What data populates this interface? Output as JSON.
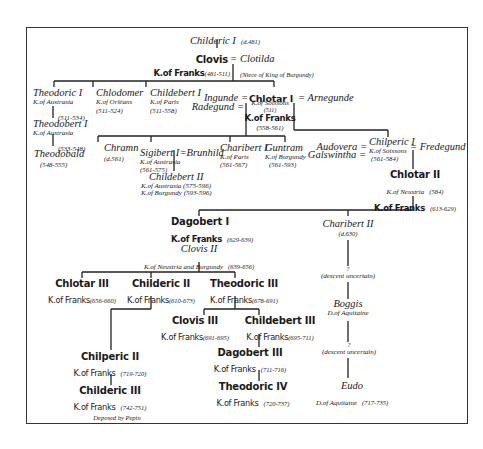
{
  "tree": {
    "childeric_i": {
      "name": "Childeric I",
      "dates": "(d.481)"
    },
    "clovis": {
      "name": "Clovis",
      "title": "K.of Franks",
      "dates": "(481-511)",
      "spouse_sep": "=",
      "spouse": "Clotilda",
      "spouse_note": "(Niece of King of Burgundy)"
    },
    "theodoric_i": {
      "name": "Theodoric I",
      "title": "K.of Austrasia",
      "dates": "(511-534)"
    },
    "theodobert_i": {
      "name": "Theodobert I",
      "title": "K.of Austrasia",
      "dates": "(533-548)"
    },
    "theodobald": {
      "name": "Theodobald",
      "dates": "(548-555)"
    },
    "chlodomer": {
      "name": "Chlodomer",
      "title": "K.of Orléans",
      "dates": "(511-524)"
    },
    "childebert_i": {
      "name": "Childebert I",
      "title": "K.of Paris",
      "dates": "(511-558)"
    },
    "chlotar_i": {
      "name": "Chlotar I",
      "spouse_left": "Ingunde =",
      "spouse_left2": "Radegund =",
      "spouse_right": "= Arnegunde",
      "title": "K.of Soissons",
      "dates1": "(511)",
      "title2": "K.of Franks",
      "dates2": "(558-561)"
    },
    "chramn": {
      "name": "Chramn",
      "dates": "(d.561)"
    },
    "sigibert_i": {
      "name": "Sigibert I",
      "spouse_sep": "=",
      "spouse": "Brunhild",
      "title": "K.of Austrasia",
      "dates": "(561-575)"
    },
    "childebert_ii": {
      "name": "Childebert II",
      "title": "K.of Austrasia (575-596)",
      "title2": "K.of Burgundy (593-596)"
    },
    "charibert_i": {
      "name": "Charibert I",
      "title": "K.of Paris",
      "dates": "(561-567)"
    },
    "guntram": {
      "name": "Guntram",
      "title": "K.of Burgundy",
      "dates": "(561-593)"
    },
    "chilperic_i": {
      "name": "Chilperic I",
      "spouse_left": "Audovera =",
      "spouse_left2": "Galswintha =",
      "spouse_right": "= Fredegund",
      "title": "K.of Soissons",
      "dates": "(561-584)"
    },
    "chlotar_ii": {
      "name": "Chlotar II",
      "title": "K.of Neustria",
      "title_dates": "(584)",
      "title2": "K.of Franks",
      "dates2": "(613-629)"
    },
    "dagobert_i": {
      "name": "Dagobert I",
      "title": "K.of Franks",
      "dates": "(629-639)"
    },
    "charibert_ii": {
      "name": "Charibert II",
      "dates": "(d.630)"
    },
    "clovis_ii": {
      "name": "Clovis II",
      "title": "K.of Neustria and Burgundy",
      "dates": "(639-656)"
    },
    "chlotar_iii": {
      "name": "Chlotar III",
      "title": "K.of Franks",
      "dates": "(656-660)"
    },
    "childeric_ii": {
      "name": "Childeric II",
      "title": "K.of Franks",
      "dates": "(610-673)"
    },
    "theodoric_iii": {
      "name": "Theodoric III",
      "title": "K.of Franks",
      "dates": "(678-691)"
    },
    "clovis_iii": {
      "name": "Clovis III",
      "title": "K.of Franks",
      "dates": "(691-695)"
    },
    "childebert_iii": {
      "name": "Childebert III",
      "title": "K.of Franks",
      "dates": "(695-711)"
    },
    "dagobert_iii": {
      "name": "Dagobert III",
      "title": "K.of Franks",
      "dates": "(711-716)"
    },
    "theodoric_iv": {
      "name": "Theodoric IV",
      "title": "K.of Franks",
      "dates": "(720-737)"
    },
    "chilperic_ii": {
      "name": "Chilperic II",
      "title": "K.of Franks",
      "dates": "(719-720)"
    },
    "childeric_iii": {
      "name": "Childeric III",
      "title": "K.of Franks",
      "dates": "(742-751)",
      "note": "Deposed by Pepin"
    },
    "uncertain_1": {
      "mark": "?",
      "text": "(descent uncertain)"
    },
    "boggis": {
      "name": "Boggis",
      "title": "D.of Aquitaine"
    },
    "uncertain_2": {
      "mark": "?",
      "text": "(descent uncertain)"
    },
    "eudo": {
      "name": "Eudo",
      "title": "D.of Aquitaine",
      "dates": "(717-735)"
    }
  }
}
